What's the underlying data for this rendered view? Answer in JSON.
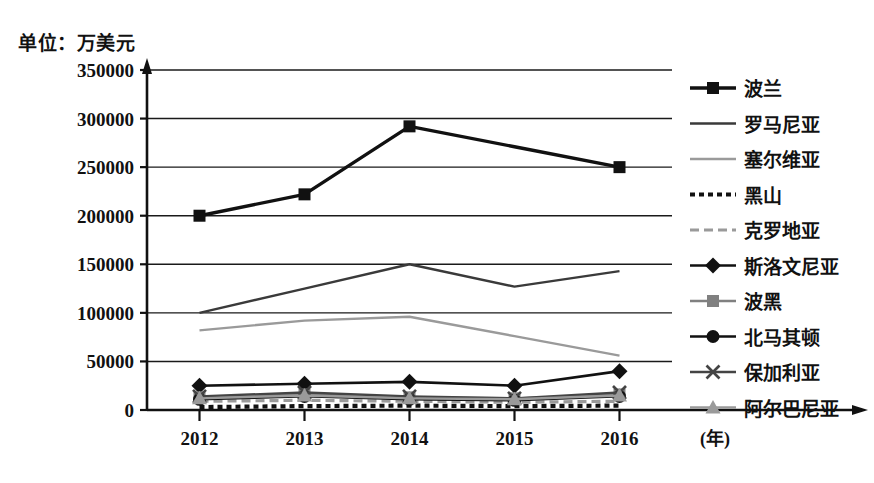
{
  "chart_data": {
    "type": "line",
    "title": "单位：万美元",
    "xlabel": "(年)",
    "ylabel": "",
    "x": [
      "2012",
      "2013",
      "2014",
      "2015",
      "2016"
    ],
    "categories": [
      "2012",
      "2013",
      "2014",
      "2015",
      "2016"
    ],
    "ylim": [
      0,
      350000
    ],
    "ytick_labels": [
      "0",
      "50000",
      "100000",
      "150000",
      "200000",
      "250000",
      "300000",
      "350000"
    ],
    "ytick_values": [
      0,
      50000,
      100000,
      150000,
      200000,
      250000,
      300000,
      350000
    ],
    "grid": true,
    "legend_position": "right",
    "series": [
      {
        "name": "波兰",
        "marker": "square",
        "color": "#111111",
        "line_style": "solid",
        "values": [
          200000,
          222000,
          292000,
          271000,
          250000
        ],
        "marker_at": [
          true,
          true,
          true,
          false,
          true
        ]
      },
      {
        "name": "罗马尼亚",
        "marker": "none",
        "color": "#3a3a3a",
        "line_style": "solid",
        "values": [
          100000,
          125000,
          150000,
          127000,
          143000
        ],
        "marker_at": [
          false,
          false,
          false,
          false,
          false
        ]
      },
      {
        "name": "塞尔维亚",
        "marker": "none",
        "color": "#9a9a9a",
        "line_style": "solid",
        "values": [
          82000,
          92000,
          96000,
          76000,
          56000
        ],
        "marker_at": [
          false,
          false,
          false,
          false,
          false
        ]
      },
      {
        "name": "黑山",
        "marker": "none",
        "color": "#111111",
        "line_style": "dotted",
        "values": [
          3000,
          4000,
          4500,
          4000,
          4500
        ],
        "marker_at": [
          false,
          false,
          false,
          false,
          false
        ]
      },
      {
        "name": "克罗地亚",
        "marker": "none",
        "color": "#9a9a9a",
        "line_style": "dashed",
        "values": [
          9000,
          10000,
          9000,
          8000,
          9000
        ],
        "marker_at": [
          false,
          false,
          false,
          false,
          false
        ]
      },
      {
        "name": "斯洛文尼亚",
        "marker": "diamond",
        "color": "#111111",
        "line_style": "solid",
        "values": [
          25000,
          27000,
          29000,
          25000,
          40000
        ],
        "marker_at": [
          true,
          true,
          true,
          true,
          true
        ]
      },
      {
        "name": "波黑",
        "marker": "square",
        "color": "#808080",
        "line_style": "solid",
        "values": [
          13000,
          16000,
          13000,
          12000,
          16000
        ],
        "marker_at": [
          true,
          true,
          true,
          true,
          true
        ]
      },
      {
        "name": "北马其顿",
        "marker": "circle",
        "color": "#111111",
        "line_style": "solid",
        "values": [
          11000,
          14000,
          11000,
          10000,
          14000
        ],
        "marker_at": [
          true,
          true,
          true,
          true,
          true
        ]
      },
      {
        "name": "保加利亚",
        "marker": "cross",
        "color": "#444444",
        "line_style": "solid",
        "values": [
          14000,
          18000,
          14000,
          12000,
          18000
        ],
        "marker_at": [
          true,
          true,
          true,
          true,
          true
        ]
      },
      {
        "name": "阿尔巴尼亚",
        "marker": "triangle",
        "color": "#9a9a9a",
        "line_style": "solid",
        "values": [
          12000,
          15000,
          12000,
          11000,
          15000
        ],
        "marker_at": [
          true,
          true,
          true,
          true,
          true
        ]
      }
    ]
  }
}
